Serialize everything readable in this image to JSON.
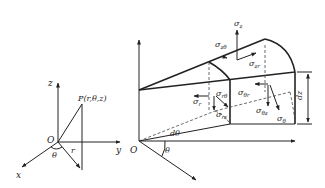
{
  "left_diagram": {
    "axes": {
      "x": "x",
      "y": "y",
      "z": "z"
    },
    "origin": "O",
    "point_label": "P(r,θ,z)",
    "angle": "θ",
    "radius": "r"
  },
  "right_diagram": {
    "origin": "O",
    "angle": "θ",
    "angle_increment": "dθ",
    "height_increment": "dz",
    "stresses": {
      "sigma_z": {
        "base": "σ",
        "sub": "z"
      },
      "sigma_ztheta": {
        "base": "σ",
        "sub": "zθ"
      },
      "sigma_zr": {
        "base": "σ",
        "sub": "zr"
      },
      "sigma_r": {
        "base": "σ",
        "sub": "r"
      },
      "sigma_rtheta": {
        "base": "σ",
        "sub": "rθ"
      },
      "sigma_rz": {
        "base": "σ",
        "sub": "rz"
      },
      "sigma_thetar": {
        "base": "σ",
        "sub": "θr"
      },
      "sigma_thetaz": {
        "base": "σ",
        "sub": "θz"
      },
      "sigma_theta": {
        "base": "σ",
        "sub": "θ"
      }
    }
  }
}
